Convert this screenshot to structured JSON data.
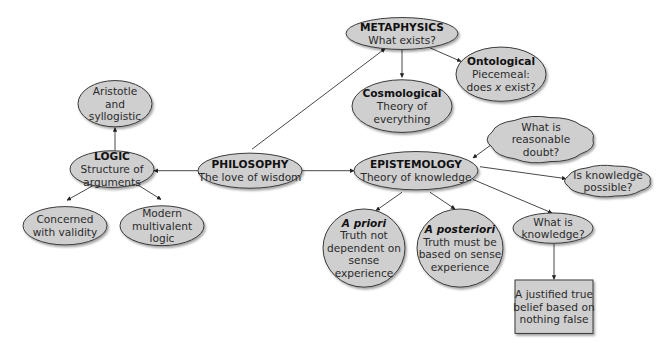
{
  "diagram": {
    "colors": {
      "node_fill": "#cfcfcf",
      "node_stroke": "#3a3a3a",
      "edge": "#333333",
      "background": "#ffffff"
    },
    "nodes": [
      {
        "id": "philosophy",
        "shape": "ellipse",
        "cx": 250,
        "cy": 214,
        "rx": 52,
        "ry": 22,
        "lines": [
          {
            "text": "PHILOSOPHY",
            "style": "bold"
          },
          {
            "text": "The love of wisdom",
            "style": "normal"
          }
        ]
      },
      {
        "id": "logic",
        "shape": "ellipse",
        "cx": 112,
        "cy": 212,
        "rx": 42,
        "ry": 23,
        "lines": [
          {
            "text": "LOGIC",
            "style": "bold"
          },
          {
            "text": "Structure of",
            "style": "normal"
          },
          {
            "text": "arguments",
            "style": "normal"
          }
        ]
      },
      {
        "id": "aristotle",
        "shape": "ellipse",
        "cx": 115,
        "cy": 130,
        "rx": 37,
        "ry": 29,
        "lines": [
          {
            "text": "Aristotle",
            "style": "normal"
          },
          {
            "text": "and",
            "style": "normal"
          },
          {
            "text": "syllogistic",
            "style": "normal"
          }
        ]
      },
      {
        "id": "validity",
        "shape": "ellipse",
        "cx": 65,
        "cy": 283,
        "rx": 42,
        "ry": 24,
        "lines": [
          {
            "text": "Concerned",
            "style": "normal"
          },
          {
            "text": "with validity",
            "style": "normal"
          }
        ]
      },
      {
        "id": "multivalent",
        "shape": "ellipse",
        "cx": 162,
        "cy": 283,
        "rx": 42,
        "ry": 25,
        "lines": [
          {
            "text": "Modern",
            "style": "normal"
          },
          {
            "text": "multivalent",
            "style": "normal"
          },
          {
            "text": "logic",
            "style": "normal"
          }
        ]
      },
      {
        "id": "metaphysics",
        "shape": "ellipse",
        "cx": 402,
        "cy": 42,
        "rx": 56,
        "ry": 20,
        "lines": [
          {
            "text": "METAPHYSICS",
            "style": "bold"
          },
          {
            "text": "What exists?",
            "style": "normal"
          }
        ]
      },
      {
        "id": "cosmological",
        "shape": "ellipse",
        "cx": 402,
        "cy": 133,
        "rx": 50,
        "ry": 33,
        "lines": [
          {
            "text": "Cosmological",
            "style": "bold"
          },
          {
            "text": "Theory of",
            "style": "normal"
          },
          {
            "text": "everything",
            "style": "normal"
          }
        ]
      },
      {
        "id": "ontological",
        "shape": "ellipse",
        "cx": 501,
        "cy": 93,
        "rx": 45,
        "ry": 34,
        "lines": [
          {
            "text": "Ontological",
            "style": "bold"
          },
          {
            "text": "Piecemeal:",
            "style": "normal"
          },
          {
            "text": "does x exist?",
            "style": "normal",
            "italic_word": "x"
          }
        ]
      },
      {
        "id": "epistemology",
        "shape": "ellipse",
        "cx": 416,
        "cy": 214,
        "rx": 62,
        "ry": 24,
        "lines": [
          {
            "text": "EPISTEMOLOGY",
            "style": "bold"
          },
          {
            "text": "Theory of knowledge",
            "style": "normal"
          }
        ]
      },
      {
        "id": "reasonable-doubt",
        "shape": "cloud",
        "cx": 541,
        "cy": 175,
        "rx": 52,
        "ry": 28,
        "lines": [
          {
            "text": "What is",
            "style": "normal"
          },
          {
            "text": "reasonable",
            "style": "normal"
          },
          {
            "text": "doubt?",
            "style": "normal"
          }
        ]
      },
      {
        "id": "knowledge-possible",
        "shape": "cloud",
        "cx": 608,
        "cy": 227,
        "rx": 42,
        "ry": 19,
        "lines": [
          {
            "text": "Is knowledge",
            "style": "normal"
          },
          {
            "text": "possible?",
            "style": "normal"
          }
        ]
      },
      {
        "id": "a-priori",
        "shape": "ellipse",
        "cx": 364,
        "cy": 311,
        "rx": 41,
        "ry": 49,
        "lines": [
          {
            "text": "A priori",
            "style": "bold-italic"
          },
          {
            "text": "Truth not",
            "style": "normal"
          },
          {
            "text": "dependent on",
            "style": "normal"
          },
          {
            "text": "sense",
            "style": "normal"
          },
          {
            "text": "experience",
            "style": "normal"
          }
        ]
      },
      {
        "id": "a-posteriori",
        "shape": "ellipse",
        "cx": 460,
        "cy": 311,
        "rx": 43,
        "ry": 49,
        "lines": [
          {
            "text": "A posteriori",
            "style": "bold-italic"
          },
          {
            "text": "Truth must be",
            "style": "normal"
          },
          {
            "text": "based on sense",
            "style": "normal"
          },
          {
            "text": "experience",
            "style": "normal"
          }
        ]
      },
      {
        "id": "what-is-knowledge",
        "shape": "ellipse",
        "cx": 553,
        "cy": 286,
        "rx": 40,
        "ry": 19,
        "lines": [
          {
            "text": "What is",
            "style": "normal"
          },
          {
            "text": "knowledge?",
            "style": "normal"
          }
        ]
      },
      {
        "id": "jtb",
        "shape": "rect",
        "x": 515,
        "y": 351,
        "w": 78,
        "h": 67,
        "lines": [
          {
            "text": "A justified true",
            "style": "normal"
          },
          {
            "text": "belief based on",
            "style": "normal"
          },
          {
            "text": "nothing false",
            "style": "normal"
          }
        ]
      }
    ],
    "edges": [
      {
        "from": "philosophy",
        "to": "logic",
        "x1": 198,
        "y1": 214,
        "x2": 154,
        "y2": 214,
        "arrow": "end"
      },
      {
        "from": "philosophy",
        "to": "metaphysics",
        "x1": 252,
        "y1": 187,
        "x2": 385,
        "y2": 61,
        "arrow": "end"
      },
      {
        "from": "philosophy",
        "to": "epistemology",
        "x1": 302,
        "y1": 214,
        "x2": 354,
        "y2": 214,
        "arrow": "end"
      },
      {
        "from": "logic",
        "to": "aristotle",
        "x1": 115,
        "y1": 189,
        "x2": 115,
        "y2": 160,
        "arrow": "end"
      },
      {
        "from": "logic",
        "to": "validity",
        "x1": 94,
        "y1": 232,
        "x2": 67,
        "y2": 251,
        "arrow": "end"
      },
      {
        "from": "logic",
        "to": "multivalent",
        "x1": 138,
        "y1": 232,
        "x2": 161,
        "y2": 250,
        "arrow": "end"
      },
      {
        "from": "metaphysics",
        "to": "cosmological",
        "x1": 402,
        "y1": 62,
        "x2": 402,
        "y2": 97,
        "arrow": "end"
      },
      {
        "from": "metaphysics",
        "to": "ontological",
        "x1": 430,
        "y1": 60,
        "x2": 461,
        "y2": 77,
        "arrow": "end"
      },
      {
        "from": "epistemology",
        "to": "reasonable-doubt",
        "x1": 473,
        "y1": 198,
        "x2": 494,
        "y2": 179,
        "arrow": "both"
      },
      {
        "from": "epistemology",
        "to": "knowledge-possible",
        "x1": 480,
        "y1": 209,
        "x2": 566,
        "y2": 224,
        "arrow": "end"
      },
      {
        "from": "epistemology",
        "to": "a-priori",
        "x1": 402,
        "y1": 241,
        "x2": 376,
        "y2": 264,
        "arrow": "end"
      },
      {
        "from": "epistemology",
        "to": "a-posteriori",
        "x1": 430,
        "y1": 241,
        "x2": 455,
        "y2": 262,
        "arrow": "end"
      },
      {
        "from": "epistemology",
        "to": "what-is-knowledge",
        "x1": 473,
        "y1": 225,
        "x2": 552,
        "y2": 267,
        "arrow": "end"
      },
      {
        "from": "what-is-knowledge",
        "to": "jtb",
        "x1": 554,
        "y1": 306,
        "x2": 554,
        "y2": 350,
        "arrow": "end"
      }
    ]
  }
}
